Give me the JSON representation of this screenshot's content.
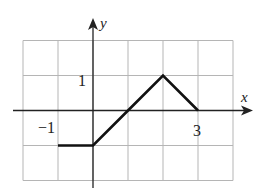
{
  "chart_data": {
    "type": "line",
    "title": "",
    "xlabel": "x",
    "ylabel": "y",
    "xlim": [
      -2,
      4
    ],
    "ylim": [
      -2,
      2
    ],
    "grid": true,
    "legend": null,
    "tick_labels": {
      "x": [
        {
          "value": -1,
          "label": "−1"
        },
        {
          "value": 3,
          "label": "3"
        }
      ],
      "y": [
        {
          "value": 1,
          "label": "1"
        }
      ]
    },
    "series": [
      {
        "name": "f(x)",
        "x": [
          -1,
          0,
          1,
          2,
          3
        ],
        "y": [
          -1,
          -1,
          0,
          1,
          0
        ]
      }
    ]
  },
  "labels": {
    "x_axis": "x",
    "y_axis": "y",
    "tick_neg1": "−1",
    "tick_3": "3",
    "tick_1": "1"
  },
  "colors": {
    "grid": "#b5b5b5",
    "axis": "#222222",
    "curve": "#111111"
  }
}
